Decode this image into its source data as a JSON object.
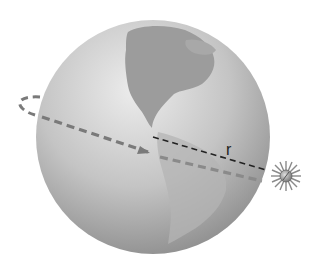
{
  "diagram": {
    "labels": {
      "radius": "r"
    },
    "colors": {
      "globe_light": "#d8d8d8",
      "globe_dark": "#8f8f8f",
      "land": "#9a9a9a",
      "orbit": "#7a7a7a",
      "radius_line": "#222222",
      "satellite": "#9a9a9a"
    },
    "elements": [
      "globe",
      "orbit-path",
      "orbit-arrow",
      "radius-line",
      "satellite"
    ]
  }
}
